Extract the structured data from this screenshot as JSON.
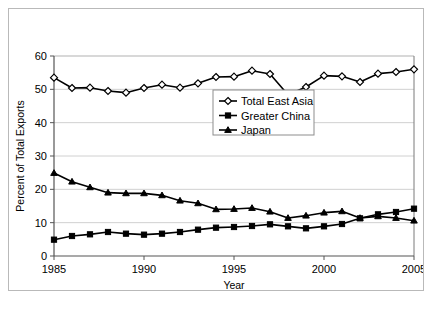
{
  "chart_data": {
    "type": "line",
    "title": "",
    "xlabel": "Year",
    "ylabel": "Percent of Total Exports",
    "xlim": [
      1985,
      2005
    ],
    "ylim": [
      0,
      60
    ],
    "ytick_step": 10,
    "yticks": [
      0,
      10,
      20,
      30,
      40,
      50,
      60
    ],
    "xticks": [
      1985,
      1990,
      1995,
      2000,
      2005
    ],
    "xtick_labels": [
      "1985",
      "1990",
      "1995",
      "2000",
      "2005"
    ],
    "ytick_labels": [
      "0",
      "10",
      "20",
      "30",
      "40",
      "50",
      "60"
    ],
    "grid": "horizontal",
    "legend_position": "center",
    "x": [
      1985,
      1986,
      1987,
      1988,
      1989,
      1990,
      1991,
      1992,
      1993,
      1994,
      1995,
      1996,
      1997,
      1998,
      1999,
      2000,
      2001,
      2002,
      2003,
      2004,
      2005
    ],
    "series": [
      {
        "name": "Total East Asia",
        "marker": "open-diamond",
        "color": "#000000",
        "fill": "#ffffff",
        "values": [
          53.5,
          50.4,
          50.5,
          49.5,
          49.0,
          50.4,
          51.4,
          50.5,
          51.8,
          53.7,
          53.8,
          55.6,
          54.6,
          48.4,
          50.7,
          54.1,
          53.9,
          52.2,
          54.7,
          55.2,
          56.0
        ]
      },
      {
        "name": "Greater China",
        "marker": "filled-square",
        "color": "#000000",
        "fill": "#000000",
        "values": [
          4.9,
          6.0,
          6.5,
          7.2,
          6.7,
          6.4,
          6.7,
          7.2,
          7.9,
          8.5,
          8.7,
          9.0,
          9.5,
          8.9,
          8.3,
          8.9,
          9.6,
          11.3,
          12.5,
          13.2,
          14.2
        ]
      },
      {
        "name": "Japan",
        "marker": "filled-triangle",
        "color": "#000000",
        "fill": "#000000",
        "values": [
          24.9,
          22.3,
          20.6,
          19.0,
          18.8,
          18.8,
          18.2,
          16.6,
          15.8,
          14.0,
          14.1,
          14.4,
          13.3,
          11.4,
          12.1,
          13.0,
          13.4,
          11.4,
          11.9,
          11.4,
          10.6
        ]
      }
    ]
  },
  "legend": {
    "entries": [
      {
        "label": "Total East Asia",
        "marker": "open-diamond"
      },
      {
        "label": "Greater China",
        "marker": "filled-square"
      },
      {
        "label": "Japan",
        "marker": "filled-triangle"
      }
    ]
  },
  "caption": {
    "text": ""
  }
}
